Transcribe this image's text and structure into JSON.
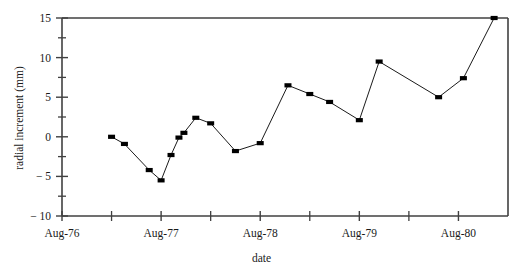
{
  "chart_data": {
    "type": "line",
    "title": "",
    "xlabel": "date",
    "ylabel": "radial increment (mm)",
    "xlim": [
      0,
      9
    ],
    "ylim": [
      -10,
      15
    ],
    "grid": false,
    "legend": null,
    "marker": "filled-square",
    "marker_color": "#000000",
    "line_color": "#000000",
    "x_unit": "half-years since Aug-76",
    "x_tick_labels": [
      "Aug-76",
      "Aug-77",
      "Aug-78",
      "Aug-79",
      "Aug-80"
    ],
    "x_tick_positions": [
      0,
      2,
      4,
      6,
      8
    ],
    "x_minor_tick_positions": [
      1,
      3,
      5,
      7
    ],
    "y_tick_labels": [
      "15",
      "10",
      "5",
      "0",
      "− 5",
      "− 10"
    ],
    "y_tick_values": [
      15,
      10,
      5,
      0,
      -5,
      -10
    ],
    "y_minor_tick_values": [
      12.5,
      7.5,
      2.5,
      -2.5,
      -7.5
    ],
    "x": [
      1.0,
      1.26,
      1.76,
      2.0,
      2.26,
      2.4,
      2.56,
      2.76,
      3.0,
      3.5,
      4.0,
      4.5,
      5.0,
      5.5,
      6.0,
      6.5,
      7.0,
      7.5,
      8.0,
      8.5,
      8.75
    ],
    "values": [
      0.0,
      -0.9,
      -4.2,
      -5.5,
      -2.3,
      -0.1,
      0.5,
      2.4,
      1.7,
      -1.8,
      -0.8,
      6.5,
      5.4,
      4.4,
      2.1,
      9.5,
      5.0,
      7.4,
      15.0,
      15.0,
      15.0
    ],
    "points": [
      {
        "x": 1.0,
        "y": 0.0
      },
      {
        "x": 1.26,
        "y": -0.9
      },
      {
        "x": 1.76,
        "y": -4.2
      },
      {
        "x": 2.0,
        "y": -5.5
      },
      {
        "x": 2.2,
        "y": -2.3
      },
      {
        "x": 2.36,
        "y": -0.1
      },
      {
        "x": 2.46,
        "y": 0.5
      },
      {
        "x": 2.7,
        "y": 2.4
      },
      {
        "x": 3.0,
        "y": 1.7
      },
      {
        "x": 3.5,
        "y": -1.8
      },
      {
        "x": 4.0,
        "y": -0.8
      },
      {
        "x": 4.56,
        "y": 6.5
      },
      {
        "x": 5.0,
        "y": 5.4
      },
      {
        "x": 5.4,
        "y": 4.4
      },
      {
        "x": 6.0,
        "y": 2.1
      },
      {
        "x": 6.4,
        "y": 9.5
      },
      {
        "x": 7.6,
        "y": 5.0
      },
      {
        "x": 8.1,
        "y": 7.4
      },
      {
        "x": 8.72,
        "y": 15.0
      }
    ]
  },
  "axes": {
    "ylabel": "radial increment (mm)",
    "xlabel": "date"
  }
}
